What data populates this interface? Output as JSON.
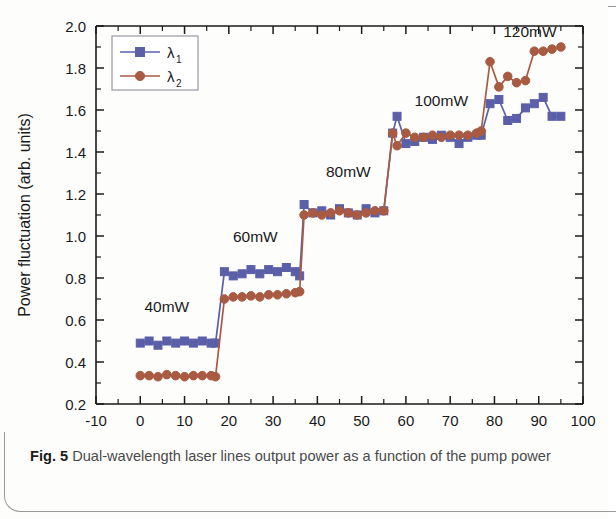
{
  "caption": {
    "label": "Fig. 5",
    "text": "Dual-wavelength laser lines output power as a function of the pump power"
  },
  "chart_data": {
    "type": "line",
    "title": "",
    "xlabel": "Scan time (min)",
    "ylabel": "Power fluctuation (arb. units)",
    "xlim": [
      -10,
      100
    ],
    "ylim": [
      0.2,
      2.0
    ],
    "xticks": [
      -10,
      0,
      10,
      20,
      30,
      40,
      50,
      60,
      70,
      80,
      90,
      100
    ],
    "yticks": [
      0.2,
      0.4,
      0.6,
      0.8,
      1.0,
      1.2,
      1.4,
      1.6,
      1.8,
      2.0
    ],
    "xtick_labels": [
      "-10",
      "0",
      "10",
      "20",
      "30",
      "40",
      "50",
      "60",
      "70",
      "80",
      "90",
      "100"
    ],
    "ytick_labels": [
      "0.2",
      "0.4",
      "0.6",
      "0.8",
      "1.0",
      "1.2",
      "1.4",
      "1.6",
      "1.8",
      "2.0"
    ],
    "minor_ticks": true,
    "grid": false,
    "legend_position": "top-left",
    "legend": [
      "λ1",
      "λ2"
    ],
    "colors": {
      "lambda1": "#5a5fa8",
      "lambda2": "#a85b42",
      "axis": "#1a1a1a"
    },
    "series": [
      {
        "name": "λ1",
        "marker": "square",
        "color": "#5a5fa8",
        "x": [
          0,
          2,
          4,
          6,
          8,
          10,
          12,
          14,
          16,
          17,
          19,
          21,
          23,
          25,
          27,
          29,
          31,
          33,
          35,
          36,
          37,
          39,
          41,
          43,
          45,
          47,
          49,
          51,
          53,
          55,
          57,
          58,
          60,
          62,
          64,
          66,
          68,
          70,
          72,
          74,
          76,
          77,
          79,
          81,
          83,
          85,
          87,
          89,
          91,
          93,
          95
        ],
        "y": [
          0.49,
          0.5,
          0.48,
          0.5,
          0.49,
          0.5,
          0.49,
          0.5,
          0.49,
          0.49,
          0.83,
          0.81,
          0.82,
          0.84,
          0.82,
          0.84,
          0.83,
          0.85,
          0.83,
          0.81,
          1.15,
          1.11,
          1.12,
          1.1,
          1.13,
          1.11,
          1.1,
          1.13,
          1.11,
          1.12,
          1.49,
          1.57,
          1.44,
          1.45,
          1.47,
          1.46,
          1.48,
          1.47,
          1.44,
          1.47,
          1.48,
          1.48,
          1.63,
          1.65,
          1.55,
          1.56,
          1.61,
          1.63,
          1.66,
          1.57,
          1.57
        ]
      },
      {
        "name": "λ2",
        "marker": "circle",
        "color": "#a85b42",
        "x": [
          0,
          2,
          4,
          6,
          8,
          10,
          12,
          14,
          16,
          17,
          19,
          21,
          23,
          25,
          27,
          29,
          31,
          33,
          35,
          36,
          37,
          39,
          41,
          43,
          45,
          47,
          49,
          51,
          53,
          55,
          57,
          58,
          60,
          62,
          64,
          66,
          68,
          70,
          72,
          74,
          76,
          77,
          79,
          81,
          83,
          85,
          87,
          89,
          91,
          93,
          95
        ],
        "y": [
          0.335,
          0.335,
          0.33,
          0.34,
          0.335,
          0.33,
          0.335,
          0.335,
          0.335,
          0.33,
          0.7,
          0.71,
          0.71,
          0.715,
          0.71,
          0.72,
          0.72,
          0.725,
          0.73,
          0.735,
          1.1,
          1.11,
          1.1,
          1.11,
          1.12,
          1.11,
          1.1,
          1.11,
          1.12,
          1.12,
          1.49,
          1.43,
          1.49,
          1.47,
          1.47,
          1.48,
          1.47,
          1.48,
          1.48,
          1.48,
          1.49,
          1.5,
          1.83,
          1.71,
          1.76,
          1.73,
          1.74,
          1.88,
          1.88,
          1.89,
          1.9
        ]
      }
    ],
    "annotations": [
      {
        "text": "40mW",
        "x": 6,
        "y": 0.64
      },
      {
        "text": "60mW",
        "x": 26,
        "y": 0.97
      },
      {
        "text": "80mW",
        "x": 47,
        "y": 1.28
      },
      {
        "text": "100mW",
        "x": 68,
        "y": 1.62
      },
      {
        "text": "120mW",
        "x": 88,
        "y": 1.95
      }
    ]
  }
}
